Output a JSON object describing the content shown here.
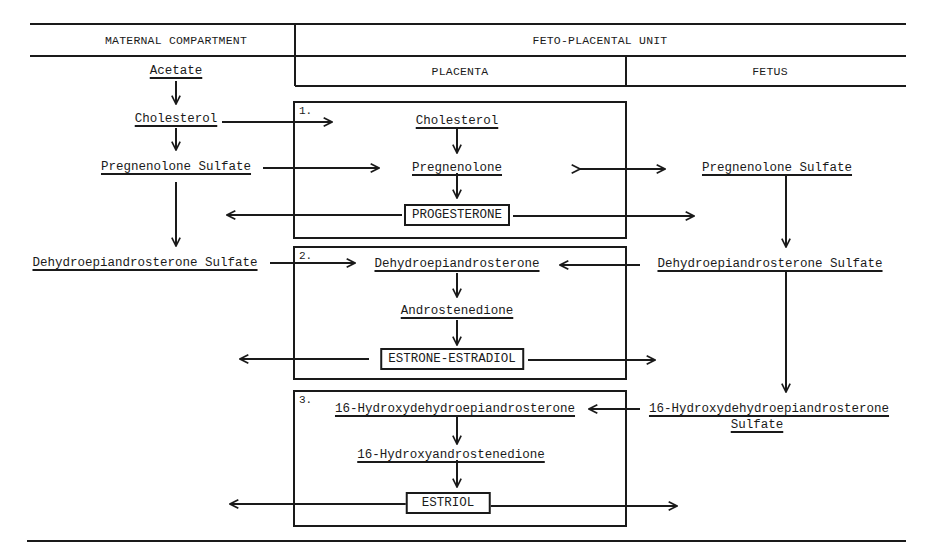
{
  "header": {
    "maternal": "MATERNAL COMPARTMENT",
    "feto_placental": "FETO-PLACENTAL UNIT",
    "placenta": "PLACENTA",
    "fetus": "FETUS"
  },
  "maternal": {
    "acetate": "Acetate",
    "cholesterol": "Cholesterol",
    "pregnenolone_sulfate": "Pregnenolone Sulfate",
    "dheas": "Dehydroepiandrosterone Sulfate"
  },
  "placenta": {
    "box1": {
      "number": "1.",
      "cholesterol": "Cholesterol",
      "pregnenolone": "Pregnenolone",
      "product": "PROGESTERONE"
    },
    "box2": {
      "number": "2.",
      "dhea": "Dehydroepiandrosterone",
      "androstenedione": "Androstenedione",
      "product": "ESTRONE-ESTRADIOL"
    },
    "box3": {
      "number": "3.",
      "hydroxy_dhea": "16-Hydroxydehydroepiandrosterone",
      "hydroxy_androstenedione": "16-Hydroxyandrostenedione",
      "product": "ESTRIOL"
    }
  },
  "fetus": {
    "pregnenolone_sulfate": "Pregnenolone Sulfate",
    "dheas": "Dehydroepiandrosterone Sulfate",
    "hydroxy_dheas_line1": "16-Hydroxydehydroepiandrosterone",
    "hydroxy_dheas_line2": "Sulfate"
  }
}
